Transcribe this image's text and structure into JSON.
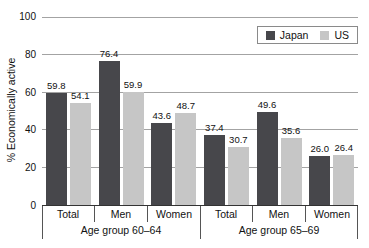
{
  "chart_data": {
    "type": "bar",
    "title": "",
    "ylabel": "% Economically active",
    "xlabel": "",
    "ylim": [
      0,
      100
    ],
    "yticks": [
      0,
      20,
      40,
      60,
      80,
      100
    ],
    "grid": true,
    "legend_position": "top-right",
    "groups": [
      {
        "label": "Age group 60–64",
        "categories": [
          "Total",
          "Men",
          "Women"
        ]
      },
      {
        "label": "Age group 65–69",
        "categories": [
          "Total",
          "Men",
          "Women"
        ]
      }
    ],
    "series": [
      {
        "name": "Japan",
        "color": "#47474b",
        "values": [
          59.8,
          76.4,
          43.6,
          37.4,
          49.6,
          26.0
        ]
      },
      {
        "name": "US",
        "color": "#c6c6c6",
        "values": [
          54.1,
          59.9,
          48.7,
          30.7,
          35.6,
          26.4
        ]
      }
    ],
    "colors": {
      "gridline": "#a3a3a3",
      "axis": "#333333",
      "separator": "#555555",
      "text": "#111111",
      "legend_border": "#8a8a8a",
      "background": "#ffffff"
    }
  }
}
